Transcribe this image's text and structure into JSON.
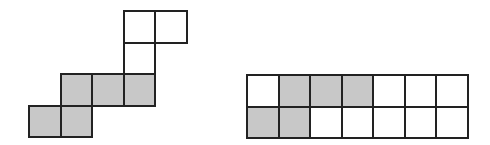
{
  "colors": {
    "shaded": "#c8c8c8",
    "empty": "#ffffff",
    "border": "#222222"
  },
  "cell_size": 31.5,
  "figures": [
    {
      "name": "staircase-figure",
      "origin": [
        29,
        11
      ],
      "cells": [
        {
          "col": 3,
          "row": 0,
          "shaded": false
        },
        {
          "col": 4,
          "row": 0,
          "shaded": false
        },
        {
          "col": 3,
          "row": 1,
          "shaded": false
        },
        {
          "col": 1,
          "row": 2,
          "shaded": true
        },
        {
          "col": 2,
          "row": 2,
          "shaded": true
        },
        {
          "col": 3,
          "row": 2,
          "shaded": true
        },
        {
          "col": 0,
          "row": 3,
          "shaded": true
        },
        {
          "col": 1,
          "row": 3,
          "shaded": true
        }
      ]
    },
    {
      "name": "rectangle-grid-figure",
      "origin": [
        247,
        75
      ],
      "cells": [
        {
          "col": 0,
          "row": 0,
          "shaded": false
        },
        {
          "col": 1,
          "row": 0,
          "shaded": true
        },
        {
          "col": 2,
          "row": 0,
          "shaded": true
        },
        {
          "col": 3,
          "row": 0,
          "shaded": true
        },
        {
          "col": 4,
          "row": 0,
          "shaded": false
        },
        {
          "col": 5,
          "row": 0,
          "shaded": false
        },
        {
          "col": 6,
          "row": 0,
          "shaded": false
        },
        {
          "col": 0,
          "row": 1,
          "shaded": true
        },
        {
          "col": 1,
          "row": 1,
          "shaded": true
        },
        {
          "col": 2,
          "row": 1,
          "shaded": false
        },
        {
          "col": 3,
          "row": 1,
          "shaded": false
        },
        {
          "col": 4,
          "row": 1,
          "shaded": false
        },
        {
          "col": 5,
          "row": 1,
          "shaded": false
        },
        {
          "col": 6,
          "row": 1,
          "shaded": false
        }
      ]
    }
  ]
}
